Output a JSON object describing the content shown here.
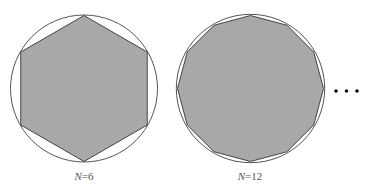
{
  "figure": {
    "panels": [
      {
        "sides": 6,
        "label_var": "N",
        "label_eq": "=6",
        "center": [
          84,
          88.5
        ],
        "radius": 73
      },
      {
        "sides": 12,
        "label_var": "N",
        "label_eq": "=12",
        "center": [
          250.5,
          88.5
        ],
        "radius": 73
      }
    ],
    "continuation": "...",
    "colors": {
      "fill": "#a8a8a8",
      "stroke": "#444444",
      "circle": "#555555"
    }
  }
}
